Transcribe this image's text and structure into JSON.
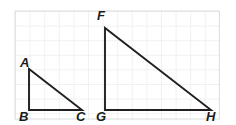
{
  "figure": {
    "background_color": "#ffffff",
    "grid": {
      "line_color": "#e3e3e6",
      "border_color": "#dcdcdf",
      "cell_size": 14.6,
      "origin_x": 15,
      "origin_y": 11,
      "cols": 14,
      "rows": 7.4
    },
    "stroke_color": "#231f20",
    "stroke_width": 1.9,
    "triangles": [
      {
        "name": "triangle-abc",
        "label_set": [
          "A",
          "B",
          "C"
        ],
        "vertices": {
          "A": {
            "x": 29,
            "y": 69
          },
          "B": {
            "x": 29,
            "y": 110
          },
          "C": {
            "x": 82,
            "y": 110
          }
        },
        "legs": {
          "vertical": 41,
          "horizontal": 53
        }
      },
      {
        "name": "triangle-fgh",
        "label_set": [
          "F",
          "G",
          "H"
        ],
        "vertices": {
          "F": {
            "x": 105,
            "y": 28
          },
          "G": {
            "x": 105,
            "y": 110
          },
          "H": {
            "x": 211,
            "y": 110
          }
        },
        "legs": {
          "vertical": 82,
          "horizontal": 106
        }
      }
    ],
    "labels": [
      {
        "id": "label-a",
        "text": "A",
        "left": 20,
        "top": 56
      },
      {
        "id": "label-b",
        "text": "B",
        "left": 19,
        "top": 110
      },
      {
        "id": "label-c",
        "text": "C",
        "left": 76,
        "top": 110
      },
      {
        "id": "label-f",
        "text": "F",
        "left": 97,
        "top": 9
      },
      {
        "id": "label-g",
        "text": "G",
        "left": 96,
        "top": 110
      },
      {
        "id": "label-h",
        "text": "H",
        "left": 206,
        "top": 110
      }
    ]
  }
}
